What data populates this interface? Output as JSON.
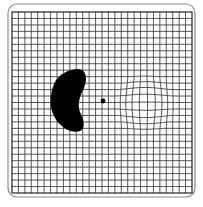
{
  "figure": {
    "type": "amsler-grid",
    "frame": {
      "x": 8,
      "y": 4,
      "width": 187,
      "height": 193,
      "radius": 9,
      "stroke": "#8a8a8a"
    },
    "grid": {
      "x": 12,
      "y": 12,
      "width": 180,
      "height": 181,
      "cells": 28,
      "line_color": "#3a3a3a",
      "border_color": "#222222"
    },
    "fixation_dot": {
      "cx": 103,
      "cy": 101,
      "r": 2.4,
      "color": "#000000"
    },
    "scotoma": {
      "color": "#000000",
      "label": "scotoma"
    },
    "distortion": {
      "cx": 145,
      "cy": 104,
      "r": 33,
      "strength": 0.35,
      "label": "metamorphopsia"
    }
  },
  "caption": ""
}
